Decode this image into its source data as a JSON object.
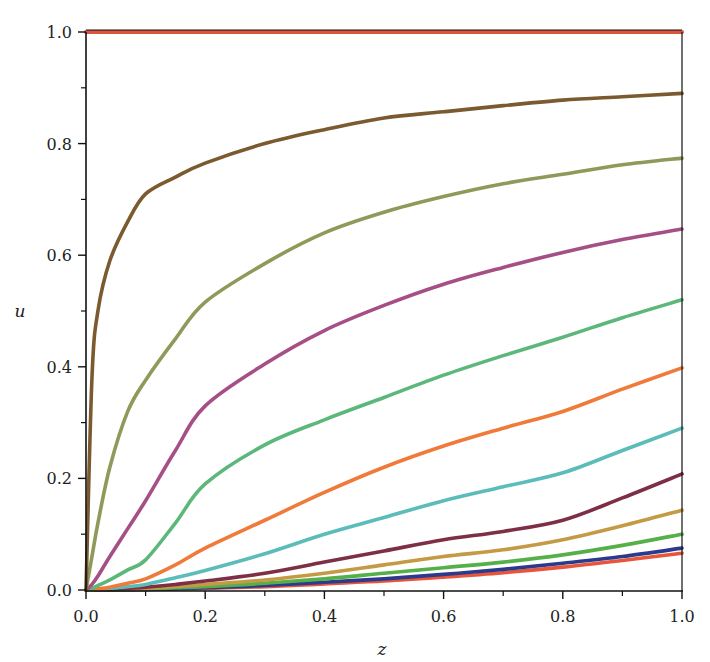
{
  "chart_data": {
    "type": "line",
    "title": "",
    "xlabel": "z",
    "ylabel": "u",
    "xlim": [
      0,
      1
    ],
    "ylim": [
      0,
      1
    ],
    "grid": false,
    "legend": "none",
    "x_ticks": [
      "0.0",
      "0.2",
      "0.4",
      "0.6",
      "0.8",
      "1.0"
    ],
    "y_ticks": [
      "0.0",
      "0.2",
      "0.4",
      "0.6",
      "0.8",
      "1.0"
    ],
    "x": [
      0,
      0.01,
      0.02,
      0.04,
      0.07,
      0.1,
      0.15,
      0.2,
      0.3,
      0.4,
      0.5,
      0.6,
      0.7,
      0.8,
      0.9,
      1.0
    ],
    "series": [
      {
        "name": "curve-1",
        "color": "#d9553f",
        "values": [
          1.0,
          1.0,
          1.0,
          1.0,
          1.0,
          1.0,
          1.0,
          1.0,
          1.0,
          1.0,
          1.0,
          1.0,
          1.0,
          1.0,
          1.0,
          1.0
        ]
      },
      {
        "name": "curve-2",
        "color": "#7a5a2e",
        "values": [
          0.0,
          0.38,
          0.5,
          0.59,
          0.66,
          0.71,
          0.74,
          0.765,
          0.8,
          0.825,
          0.846,
          0.857,
          0.868,
          0.878,
          0.884,
          0.89
        ]
      },
      {
        "name": "curve-3",
        "color": "#8f9a5a",
        "values": [
          0.0,
          0.06,
          0.12,
          0.22,
          0.32,
          0.376,
          0.45,
          0.516,
          0.585,
          0.64,
          0.677,
          0.705,
          0.728,
          0.745,
          0.762,
          0.774
        ]
      },
      {
        "name": "curve-4",
        "color": "#a64f86",
        "values": [
          0.0,
          0.01,
          0.025,
          0.06,
          0.11,
          0.16,
          0.25,
          0.33,
          0.405,
          0.465,
          0.51,
          0.548,
          0.578,
          0.605,
          0.628,
          0.647
        ]
      },
      {
        "name": "curve-5",
        "color": "#5cb87a",
        "values": [
          0.0,
          0.003,
          0.008,
          0.018,
          0.036,
          0.054,
          0.12,
          0.19,
          0.26,
          0.305,
          0.345,
          0.385,
          0.42,
          0.453,
          0.488,
          0.52
        ]
      },
      {
        "name": "curve-6",
        "color": "#f07a3a",
        "values": [
          0.0,
          0.001,
          0.002,
          0.005,
          0.012,
          0.02,
          0.045,
          0.075,
          0.125,
          0.175,
          0.22,
          0.258,
          0.29,
          0.32,
          0.36,
          0.398
        ]
      },
      {
        "name": "curve-7",
        "color": "#5bbcba",
        "values": [
          0.0,
          0.0,
          0.001,
          0.003,
          0.006,
          0.01,
          0.022,
          0.035,
          0.065,
          0.1,
          0.13,
          0.16,
          0.185,
          0.21,
          0.25,
          0.29
        ]
      },
      {
        "name": "curve-8",
        "color": "#7d2f45",
        "values": [
          0.0,
          0.0,
          0.0,
          0.001,
          0.003,
          0.005,
          0.01,
          0.016,
          0.03,
          0.05,
          0.07,
          0.09,
          0.105,
          0.125,
          0.165,
          0.208
        ]
      },
      {
        "name": "curve-9",
        "color": "#c49a45",
        "values": [
          0.0,
          0.0,
          0.0,
          0.001,
          0.002,
          0.003,
          0.006,
          0.01,
          0.018,
          0.03,
          0.045,
          0.06,
          0.072,
          0.09,
          0.115,
          0.143
        ]
      },
      {
        "name": "curve-10",
        "color": "#55b04a",
        "values": [
          0.0,
          0.0,
          0.0,
          0.0,
          0.001,
          0.002,
          0.004,
          0.006,
          0.012,
          0.02,
          0.03,
          0.04,
          0.05,
          0.063,
          0.08,
          0.1
        ]
      },
      {
        "name": "curve-11",
        "color": "#2b3a8c",
        "values": [
          0.0,
          0.0,
          0.0,
          0.0,
          0.001,
          0.001,
          0.002,
          0.004,
          0.008,
          0.014,
          0.02,
          0.028,
          0.037,
          0.048,
          0.06,
          0.075
        ]
      },
      {
        "name": "curve-12",
        "color": "#e8553a",
        "values": [
          0.0,
          0.0,
          0.0,
          0.0,
          0.0,
          0.001,
          0.002,
          0.003,
          0.006,
          0.011,
          0.016,
          0.023,
          0.031,
          0.041,
          0.053,
          0.066
        ]
      }
    ]
  },
  "axes": {
    "x_label": "z",
    "y_label": "u",
    "x_tick_labels": [
      "0.0",
      "0.2",
      "0.4",
      "0.6",
      "0.8",
      "1.0"
    ],
    "y_tick_labels": [
      "0.0",
      "0.2",
      "0.4",
      "0.6",
      "0.8",
      "1.0"
    ]
  }
}
